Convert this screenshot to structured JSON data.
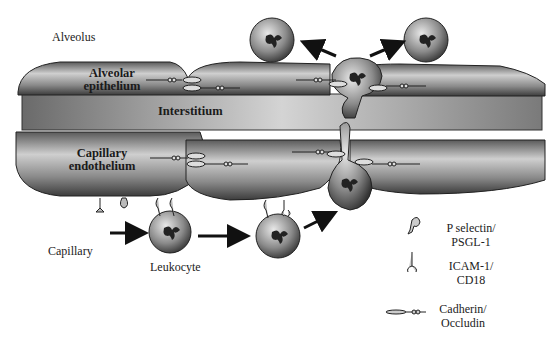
{
  "figure": {
    "regions": {
      "alveolus": "Alveolus",
      "alveolar_epithelium_l1": "Alveolar",
      "alveolar_epithelium_l2": "epithelium",
      "interstitium": "Interstitium",
      "capillary_endothelium_l1": "Capillary",
      "capillary_endothelium_l2": "endothelium",
      "capillary": "Capillary",
      "leukocyte": "Leukocyte"
    },
    "legend": [
      {
        "icon": "p-selectin-icon",
        "line1": "P selectin/",
        "line2": "PSGL-1"
      },
      {
        "icon": "icam-icon",
        "line1": "ICAM-1/",
        "line2": "CD18"
      },
      {
        "icon": "cadherin-icon",
        "line1": "Cadherin/",
        "line2": "Occludin"
      }
    ],
    "colors": {
      "cell_dark": "#3a3a3a",
      "cell_light": "#d8d8d8",
      "interstitium": "#8a8a8a",
      "arrow": "#111111"
    }
  }
}
